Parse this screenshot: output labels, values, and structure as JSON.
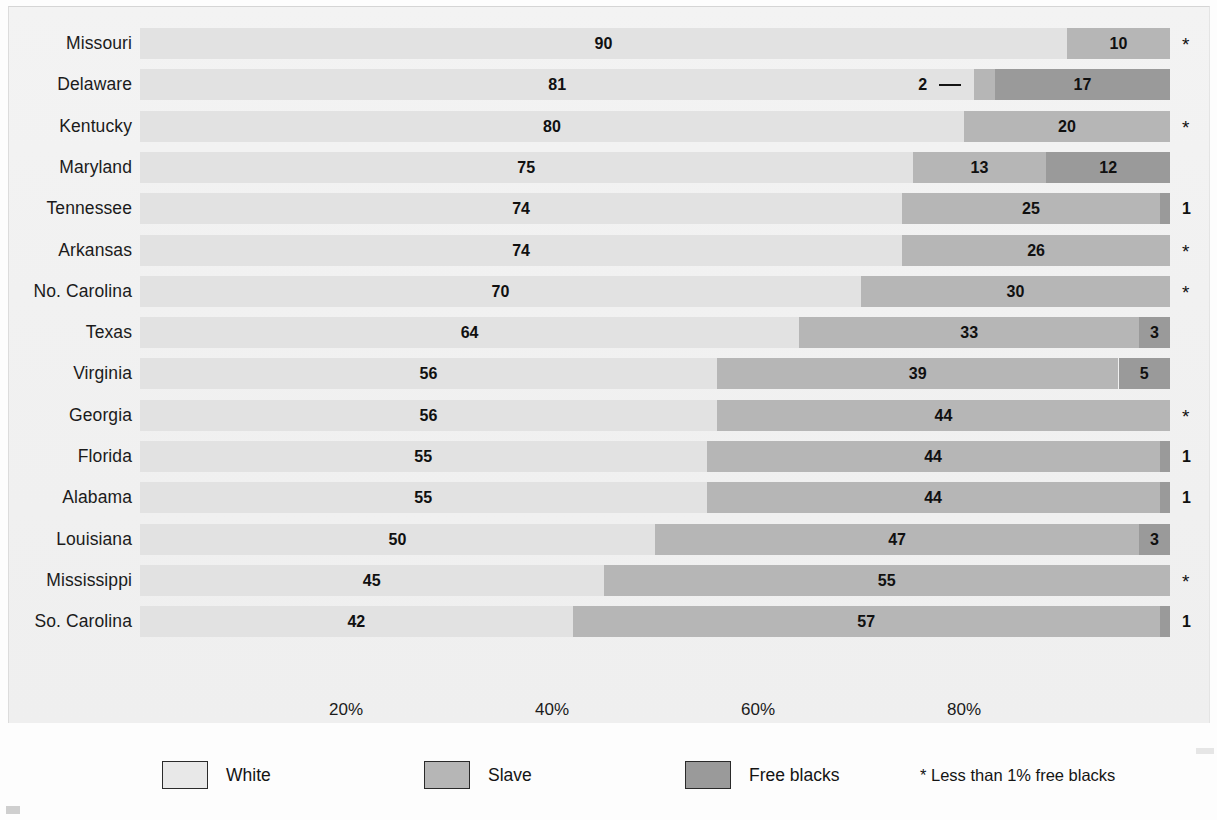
{
  "chart_data": {
    "type": "bar",
    "subtype": "stacked-horizontal-100percent",
    "title": "",
    "xlabel": "",
    "ylabel": "",
    "xlim": [
      0,
      100
    ],
    "grid": false,
    "legend_position": "bottom",
    "categories": [
      "Missouri",
      "Delaware",
      "Kentucky",
      "Maryland",
      "Tennessee",
      "Arkansas",
      "No. Carolina",
      "Texas",
      "Virginia",
      "Georgia",
      "Florida",
      "Alabama",
      "Louisiana",
      "Mississippi",
      "So. Carolina"
    ],
    "series": [
      {
        "name": "White",
        "color": "#e2e2e2",
        "values": [
          90,
          81,
          80,
          75,
          74,
          74,
          70,
          64,
          56,
          56,
          55,
          55,
          50,
          45,
          42
        ]
      },
      {
        "name": "Slave",
        "color": "#b6b6b6",
        "values": [
          10,
          2,
          20,
          13,
          25,
          26,
          30,
          33,
          39,
          44,
          44,
          44,
          47,
          55,
          57
        ]
      },
      {
        "name": "Free blacks",
        "color": "#9a9a9a",
        "values": [
          0,
          17,
          0,
          12,
          1,
          0,
          0,
          3,
          5,
          0,
          1,
          1,
          3,
          0,
          1
        ]
      }
    ],
    "xticks": [
      {
        "value": 20,
        "label": "20%"
      },
      {
        "value": 40,
        "label": "40%"
      },
      {
        "value": 60,
        "label": "60%"
      },
      {
        "value": 80,
        "label": "80%"
      }
    ],
    "rows": [
      {
        "label": "Missouri",
        "white": 90,
        "slave": 10,
        "free": 0,
        "white_label": "90",
        "slave_label": "10",
        "free_label": "",
        "slave_outside": false,
        "tail": "*"
      },
      {
        "label": "Delaware",
        "white": 81,
        "slave": 2,
        "free": 17,
        "white_label": "81",
        "slave_label": "2",
        "free_label": "17",
        "slave_outside": true,
        "tail": ""
      },
      {
        "label": "Kentucky",
        "white": 80,
        "slave": 20,
        "free": 0,
        "white_label": "80",
        "slave_label": "20",
        "free_label": "",
        "slave_outside": false,
        "tail": "*"
      },
      {
        "label": "Maryland",
        "white": 75,
        "slave": 13,
        "free": 12,
        "white_label": "75",
        "slave_label": "13",
        "free_label": "12",
        "slave_outside": false,
        "tail": ""
      },
      {
        "label": "Tennessee",
        "white": 74,
        "slave": 25,
        "free": 1,
        "white_label": "74",
        "slave_label": "25",
        "free_label": "",
        "slave_outside": false,
        "tail": "1"
      },
      {
        "label": "Arkansas",
        "white": 74,
        "slave": 26,
        "free": 0,
        "white_label": "74",
        "slave_label": "26",
        "free_label": "",
        "slave_outside": false,
        "tail": "*"
      },
      {
        "label": "No. Carolina",
        "white": 70,
        "slave": 30,
        "free": 0,
        "white_label": "70",
        "slave_label": "30",
        "free_label": "",
        "slave_outside": false,
        "tail": "*"
      },
      {
        "label": "Texas",
        "white": 64,
        "slave": 33,
        "free": 3,
        "white_label": "64",
        "slave_label": "33",
        "free_label": "3",
        "slave_outside": false,
        "tail": ""
      },
      {
        "label": "Virginia",
        "white": 56,
        "slave": 39,
        "free": 5,
        "white_label": "56",
        "slave_label": "39",
        "free_label": "5",
        "slave_outside": false,
        "tail": ""
      },
      {
        "label": "Georgia",
        "white": 56,
        "slave": 44,
        "free": 0,
        "white_label": "56",
        "slave_label": "44",
        "free_label": "",
        "slave_outside": false,
        "tail": "*"
      },
      {
        "label": "Florida",
        "white": 55,
        "slave": 44,
        "free": 1,
        "white_label": "55",
        "slave_label": "44",
        "free_label": "",
        "slave_outside": false,
        "tail": "1"
      },
      {
        "label": "Alabama",
        "white": 55,
        "slave": 44,
        "free": 1,
        "white_label": "55",
        "slave_label": "44",
        "free_label": "",
        "slave_outside": false,
        "tail": "1"
      },
      {
        "label": "Louisiana",
        "white": 50,
        "slave": 47,
        "free": 3,
        "white_label": "50",
        "slave_label": "47",
        "free_label": "3",
        "slave_outside": false,
        "tail": ""
      },
      {
        "label": "Mississippi",
        "white": 45,
        "slave": 55,
        "free": 0,
        "white_label": "45",
        "slave_label": "55",
        "free_label": "",
        "slave_outside": false,
        "tail": "*"
      },
      {
        "label": "So. Carolina",
        "white": 42,
        "slave": 57,
        "free": 1,
        "white_label": "42",
        "slave_label": "57",
        "free_label": "",
        "slave_outside": false,
        "tail": "1"
      }
    ]
  },
  "legend": {
    "items": [
      {
        "label": "White",
        "color": "#e8e8e8",
        "swatch": "sw-white"
      },
      {
        "label": "Slave",
        "color": "#b6b6b6",
        "swatch": "sw-slave"
      },
      {
        "label": "Free blacks",
        "color": "#9a9a9a",
        "swatch": "sw-free"
      }
    ],
    "note": "* Less than 1% free blacks"
  }
}
